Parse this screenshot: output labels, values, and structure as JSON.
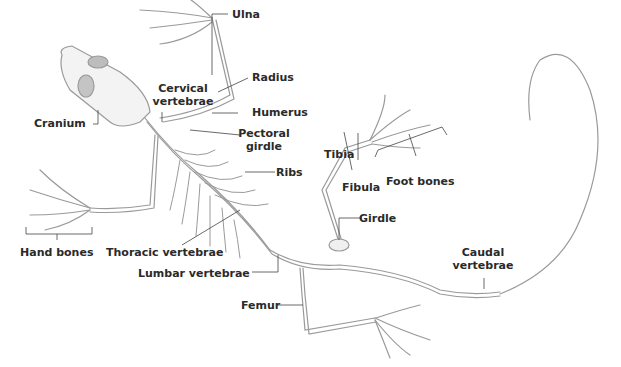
{
  "diagram": {
    "labels": {
      "ulna": "Ulna",
      "radius": "Radius",
      "cervical_1": "Cervical",
      "cervical_2": "vertebrae",
      "cranium": "Cranium",
      "humerus": "Humerus",
      "pectoral_1": "Pectoral",
      "pectoral_2": "girdle",
      "ribs": "Ribs",
      "tibia": "Tibia",
      "fibula": "Fibula",
      "foot_bones": "Foot bones",
      "girdle": "Girdle",
      "hand_bones": "Hand bones",
      "thoracic": "Thoracic vertebrae",
      "lumbar": "Lumbar vertebrae",
      "femur": "Femur",
      "caudal_1": "Caudal",
      "caudal_2": "vertebrae"
    },
    "colors": {
      "bone": "#9a9a9a",
      "leader": "#444444",
      "text": "#2a2a2a"
    }
  }
}
